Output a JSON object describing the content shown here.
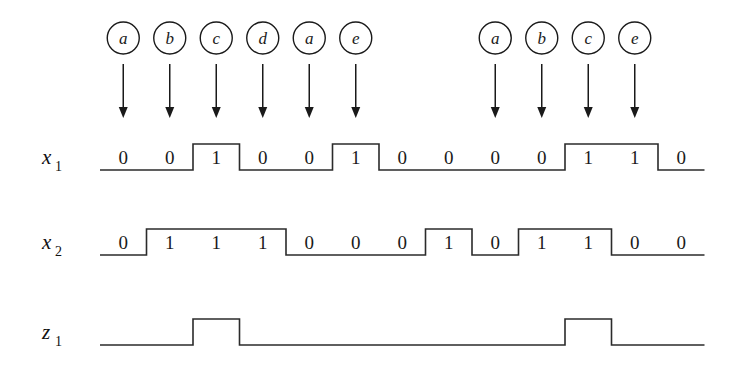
{
  "figure": {
    "type": "digital-timing-diagram",
    "background_color": "#ffffff",
    "line_color": "#2b2b2b",
    "text_color": "#1a1a1a"
  },
  "geometry": {
    "origin_x": 100,
    "slot_width": 46.5,
    "slot_count": 13,
    "wave_high_offset": -26,
    "rows": [
      {
        "baseline_y": 170
      },
      {
        "baseline_y": 255
      },
      {
        "baseline_y": 345
      }
    ],
    "circle_center_y": 38,
    "circle_radius": 16,
    "arrow_top_y": 64,
    "arrow_bottom_y": 118
  },
  "signals": [
    {
      "name_base": "x",
      "name_sub": "1",
      "label": "x1",
      "values": [
        0,
        0,
        1,
        0,
        0,
        1,
        0,
        0,
        0,
        0,
        1,
        1,
        0
      ]
    },
    {
      "name_base": "x",
      "name_sub": "2",
      "label": "x2",
      "values": [
        0,
        1,
        1,
        1,
        0,
        0,
        0,
        1,
        0,
        1,
        1,
        0,
        0
      ]
    },
    {
      "name_base": "z",
      "name_sub": "1",
      "label": "z1",
      "values": [
        0,
        0,
        1,
        0,
        0,
        0,
        0,
        0,
        0,
        0,
        1,
        0,
        0
      ],
      "hide_bit_labels": true
    }
  ],
  "events": [
    {
      "label": "a",
      "slot": 1
    },
    {
      "label": "b",
      "slot": 2
    },
    {
      "label": "c",
      "slot": 3
    },
    {
      "label": "d",
      "slot": 4
    },
    {
      "label": "a",
      "slot": 5
    },
    {
      "label": "e",
      "slot": 6
    },
    {
      "label": "a",
      "slot": 9
    },
    {
      "label": "b",
      "slot": 10
    },
    {
      "label": "c",
      "slot": 11
    },
    {
      "label": "e",
      "slot": 12
    }
  ]
}
